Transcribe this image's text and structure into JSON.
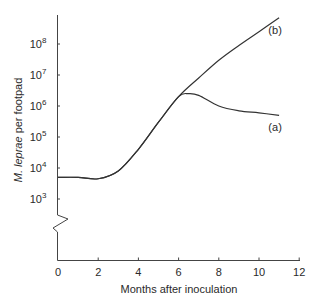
{
  "chart_data": {
    "type": "line",
    "title": "",
    "xlabel": "Months after inoculation",
    "ylabel_italic": "M. leprae",
    "ylabel_rest": " per footpad",
    "ylabel": "M. leprae per footpad",
    "yscale": "log",
    "xlim": [
      0,
      12
    ],
    "ylim": [
      1000,
      1000000000
    ],
    "grid": false,
    "axis_break": "y-axis break below 10^3",
    "x_ticks": [
      0,
      2,
      4,
      6,
      8,
      10,
      12
    ],
    "x_tick_labels": [
      "0",
      "2",
      "4",
      "6",
      "8",
      "10",
      "12"
    ],
    "y_ticks": [
      3,
      4,
      5,
      6,
      7,
      8
    ],
    "y_tick_labels": [
      {
        "base": "10",
        "exp": "3"
      },
      {
        "base": "10",
        "exp": "4"
      },
      {
        "base": "10",
        "exp": "5"
      },
      {
        "base": "10",
        "exp": "6"
      },
      {
        "base": "10",
        "exp": "7"
      },
      {
        "base": "10",
        "exp": "8"
      }
    ],
    "series": [
      {
        "name": "(a)",
        "x": [
          0,
          1,
          2,
          3,
          4,
          5,
          6,
          6.5,
          7,
          8,
          9,
          10,
          11
        ],
        "values": [
          5000,
          5000,
          4500,
          8000,
          40000,
          300000,
          2000000,
          2500000,
          2200000,
          1000000,
          700000,
          600000,
          500000
        ]
      },
      {
        "name": "(b)",
        "x": [
          0,
          1,
          2,
          3,
          4,
          5,
          6,
          7,
          8,
          9,
          10,
          11
        ],
        "values": [
          5000,
          5000,
          4500,
          8000,
          40000,
          300000,
          2000000,
          8000000,
          30000000,
          90000000,
          250000000,
          700000000
        ]
      }
    ],
    "annotations": [
      {
        "text": "(a)",
        "near_series": "(a)",
        "position": "below end of curve"
      },
      {
        "text": "(b)",
        "near_series": "(b)",
        "position": "below end of curve"
      }
    ]
  },
  "colors": {
    "line": "#333333",
    "axis": "#444444",
    "text": "#2a2a2a"
  }
}
